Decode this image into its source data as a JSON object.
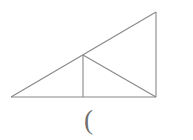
{
  "figure": {
    "background_color": "#ffffff",
    "stroke_color": "#888888",
    "stroke_width": 1.1,
    "caption": "(",
    "caption_color": "#6f6f6f",
    "canvas": {
      "width": 193,
      "height": 140
    },
    "points": {
      "left_vertex": {
        "name": "A",
        "x": 11,
        "y": 97
      },
      "right_angle_vertex": {
        "name": "B",
        "x": 156,
        "y": 97
      },
      "apex_vertex": {
        "name": "C",
        "x": 156,
        "y": 12
      },
      "hypotenuse_midpoint": {
        "name": "M",
        "x": 83,
        "y": 55
      },
      "foot_of_altitude": {
        "name": "D",
        "x": 83,
        "y": 97
      }
    },
    "segments": [
      {
        "name": "base-line",
        "label": "AB",
        "x1": 11,
        "y1": 97,
        "x2": 156,
        "y2": 97
      },
      {
        "name": "right-vertical-line",
        "label": "BC",
        "x1": 156,
        "y1": 97,
        "x2": 156,
        "y2": 12
      },
      {
        "name": "hypotenuse-line",
        "label": "AC",
        "x1": 11,
        "y1": 97,
        "x2": 156,
        "y2": 12
      },
      {
        "name": "inner-vertical-line",
        "label": "MD",
        "x1": 83,
        "y1": 55,
        "x2": 83,
        "y2": 97
      },
      {
        "name": "inner-diagonal-line",
        "label": "MB",
        "x1": 83,
        "y1": 55,
        "x2": 156,
        "y2": 97
      }
    ]
  }
}
